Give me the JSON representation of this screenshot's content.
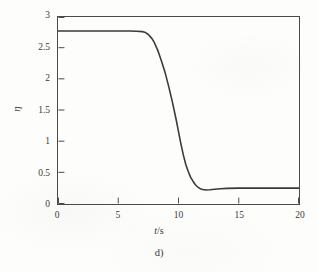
{
  "figure": {
    "caption": "d)",
    "background_color": "#fdfdfb",
    "line_color": "#3a3a3a",
    "axis_color": "#4a4a4a"
  },
  "axes": {
    "x_label_symbol": "t",
    "x_label_unit": "/s",
    "x_label_full": "t/s",
    "y_label": "η",
    "x_ticks": [
      "0",
      "5",
      "10",
      "15",
      "20"
    ],
    "y_ticks": [
      "0",
      "0.5",
      "1",
      "1.5",
      "2",
      "2.5",
      "3"
    ]
  },
  "chart_data": {
    "type": "line",
    "title": "",
    "subtitle": "",
    "xlabel": "t/s",
    "ylabel": "η",
    "xlim": [
      0,
      20
    ],
    "ylim": [
      0,
      3.2
    ],
    "xticks": [
      0,
      5,
      10,
      15,
      20
    ],
    "yticks": [
      0,
      0.5,
      1,
      1.5,
      2,
      2.5,
      3
    ],
    "grid": false,
    "legend": null,
    "annotations": [
      "d)"
    ],
    "series": [
      {
        "name": "η(t)",
        "color": "#3a3a3a",
        "linewidth": 1.6,
        "x": [
          0.0,
          0.5,
          1.0,
          1.5,
          2.0,
          2.5,
          3.0,
          3.5,
          4.0,
          4.5,
          5.0,
          5.5,
          6.0,
          6.5,
          7.0,
          7.2,
          7.5,
          7.8,
          8.0,
          8.3,
          8.6,
          8.9,
          9.2,
          9.5,
          9.8,
          10.0,
          10.2,
          10.4,
          10.6,
          10.8,
          11.0,
          11.2,
          11.4,
          11.6,
          11.8,
          12.0,
          12.3,
          12.6,
          13.0,
          13.5,
          14.0,
          15.0,
          16.0,
          17.0,
          18.0,
          19.0,
          20.0
        ],
        "y": [
          2.96,
          2.96,
          2.96,
          2.96,
          2.96,
          2.96,
          2.96,
          2.96,
          2.96,
          2.96,
          2.96,
          2.96,
          2.96,
          2.955,
          2.95,
          2.94,
          2.9,
          2.83,
          2.76,
          2.62,
          2.44,
          2.24,
          2.0,
          1.74,
          1.45,
          1.24,
          1.03,
          0.84,
          0.68,
          0.56,
          0.46,
          0.39,
          0.33,
          0.29,
          0.263,
          0.248,
          0.24,
          0.243,
          0.252,
          0.262,
          0.268,
          0.272,
          0.272,
          0.272,
          0.272,
          0.272,
          0.272
        ]
      }
    ]
  }
}
